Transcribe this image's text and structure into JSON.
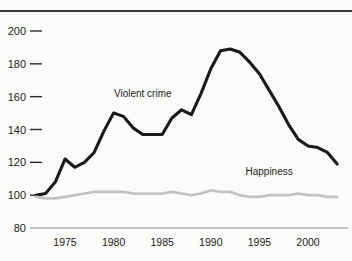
{
  "chart_data": {
    "type": "line",
    "title": "",
    "xlabel": "",
    "ylabel": "",
    "xlim": [
      1972,
      2004
    ],
    "ylim": [
      80,
      208
    ],
    "grid": false,
    "legend_position": "inline-annotations",
    "y_ticks": [
      80,
      100,
      120,
      140,
      160,
      180,
      200
    ],
    "x_ticks": [
      1975,
      1980,
      1985,
      1990,
      1995,
      2000
    ],
    "note": "Index values, 1972 = 100",
    "series": [
      {
        "name": "Violent crime",
        "color": "#1a1a1a",
        "label_x": 1983.0,
        "label_y": 160,
        "x": [
          1972,
          1973,
          1974,
          1975,
          1976,
          1977,
          1978,
          1979,
          1980,
          1981,
          1982,
          1983,
          1984,
          1985,
          1986,
          1987,
          1988,
          1989,
          1990,
          1991,
          1992,
          1993,
          1994,
          1995,
          1996,
          1997,
          1998,
          1999,
          2000,
          2001,
          2002,
          2003
        ],
        "values": [
          100,
          101,
          108,
          122,
          117,
          120,
          126,
          139,
          150,
          148,
          141,
          137,
          137,
          137,
          147,
          152,
          149,
          162,
          177,
          188,
          189,
          187,
          181,
          174,
          164,
          154,
          143,
          134,
          130,
          129,
          126,
          119
        ]
      },
      {
        "name": "Happiness",
        "color": "#c2c2c2",
        "label_x": 1996.0,
        "label_y": 112,
        "x": [
          1972,
          1973,
          1974,
          1975,
          1976,
          1977,
          1978,
          1979,
          1980,
          1981,
          1982,
          1983,
          1984,
          1985,
          1986,
          1987,
          1988,
          1989,
          1990,
          1991,
          1992,
          1993,
          1994,
          1995,
          1996,
          1997,
          1998,
          1999,
          2000,
          2001,
          2002,
          2003
        ],
        "values": [
          99,
          98,
          98,
          99,
          100,
          101,
          102,
          102,
          102,
          102,
          101,
          101,
          101,
          101,
          102,
          101,
          100,
          101,
          103,
          102,
          102,
          100,
          99,
          99,
          100,
          100,
          100,
          101,
          100,
          100,
          99,
          99
        ]
      }
    ]
  },
  "axis": {
    "y_tick_labels": [
      "200",
      "180",
      "160",
      "140",
      "120",
      "100",
      "80"
    ],
    "x_tick_labels": [
      "1975",
      "1980",
      "1985",
      "1990",
      "1995",
      "2000"
    ]
  },
  "annotations": {
    "violent_crime": "Violent crime",
    "happiness": "Happiness"
  }
}
